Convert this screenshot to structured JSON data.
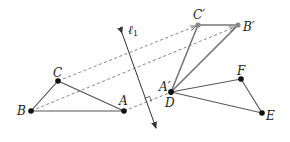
{
  "diagram": {
    "colors": {
      "line": "#555555",
      "image_line": "#777777",
      "dashed": "#777777",
      "point": "#111111",
      "image_point": "#888888",
      "label": "#222222"
    },
    "points": {
      "A": {
        "label": "A",
        "x": 124,
        "y": 111
      },
      "B": {
        "label": "B",
        "x": 31,
        "y": 111
      },
      "C": {
        "label": "C",
        "x": 58,
        "y": 81
      },
      "A_prime": {
        "label": "A′",
        "x": 171,
        "y": 92
      },
      "B_prime": {
        "label": "B′",
        "x": 238,
        "y": 25
      },
      "C_prime": {
        "label": "C′",
        "x": 198,
        "y": 25
      },
      "D": {
        "label": "D",
        "x": 171,
        "y": 92
      },
      "E": {
        "label": "E",
        "x": 262,
        "y": 113
      },
      "F": {
        "label": "F",
        "x": 241,
        "y": 79
      }
    },
    "line_of_reflection": {
      "name": "ℓ",
      "subscript": "1"
    },
    "triangles": [
      "ABC",
      "A′B′C′",
      "DEF"
    ]
  }
}
